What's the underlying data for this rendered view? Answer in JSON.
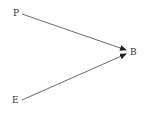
{
  "nodes": [
    {
      "id": "P",
      "label": "P"
    },
    {
      "id": "B",
      "label": "B"
    },
    {
      "id": "E",
      "label": "E"
    }
  ],
  "edges": [
    {
      "from": "P",
      "to": "B"
    },
    {
      "from": "E",
      "to": "B"
    }
  ],
  "colors": {
    "line": "#333333",
    "text": "#333333",
    "background": "#ffffff"
  }
}
